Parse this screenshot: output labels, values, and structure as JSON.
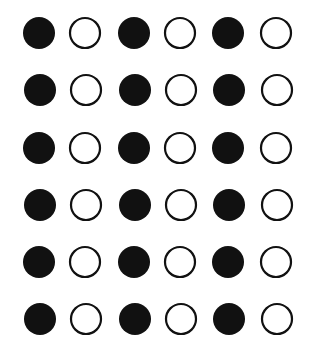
{
  "diagram": {
    "rows": 6,
    "columns": 6,
    "pattern": [
      "filled",
      "open",
      "filled",
      "open",
      "filled",
      "open"
    ],
    "column_centers_x": [
      39,
      85,
      134,
      180,
      228,
      276
    ],
    "row_centers_y": [
      33,
      90,
      148,
      205,
      262,
      319
    ],
    "filled_radius": 16,
    "open_radius": 15,
    "stroke_width": 2.2,
    "colors": {
      "fill": "#111111",
      "stroke": "#111111",
      "background": "#ffffff"
    }
  }
}
